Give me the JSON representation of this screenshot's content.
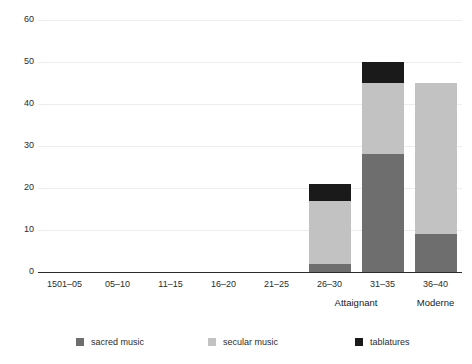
{
  "chart_data": {
    "type": "bar",
    "subtype": "stacked-vertical",
    "title": "",
    "subtitle": "",
    "xlabel": "",
    "ylabel": "",
    "ylim": [
      0,
      60
    ],
    "y_ticks": [
      0,
      10,
      20,
      30,
      40,
      50,
      60
    ],
    "y_tick_labels": [
      "0",
      "10",
      "20",
      "30",
      "40",
      "50",
      "60"
    ],
    "grid": true,
    "grid_axis": "y",
    "legend_position": "bottom",
    "categories": [
      "1501–05",
      "05–10",
      "11–15",
      "16–20",
      "21–25",
      "26–30",
      "31–35",
      "36–40"
    ],
    "series": [
      {
        "name": "sacred music",
        "color": "#6e6e6e",
        "values": [
          0,
          0,
          0,
          0,
          0,
          2,
          28,
          9
        ]
      },
      {
        "name": "secular music",
        "color": "#c2c2c2",
        "values": [
          0,
          0,
          0,
          0,
          0,
          15,
          17,
          36
        ]
      },
      {
        "name": "tablatures",
        "color": "#1a1a1a",
        "values": [
          0,
          0,
          0,
          0,
          0,
          4,
          5,
          0
        ]
      }
    ],
    "totals": [
      0,
      0,
      0,
      0,
      0,
      21,
      50,
      45
    ],
    "group_annotations": [
      {
        "label": "Attaignant",
        "spans_categories": [
          "26–30",
          "31–35"
        ]
      },
      {
        "label": "Moderne",
        "spans_categories": [
          "36–40"
        ]
      }
    ]
  },
  "legend": {
    "items": [
      {
        "label": "sacred music",
        "color": "#6e6e6e"
      },
      {
        "label": "secular music",
        "color": "#c2c2c2"
      },
      {
        "label": "tablatures",
        "color": "#1a1a1a"
      }
    ]
  },
  "colors": {
    "sacred_music": "#6e6e6e",
    "secular_music": "#c2c2c2",
    "tablatures": "#1a1a1a",
    "gridline": "#ededed",
    "axis": "#2b2b2b",
    "background": "#ffffff"
  }
}
